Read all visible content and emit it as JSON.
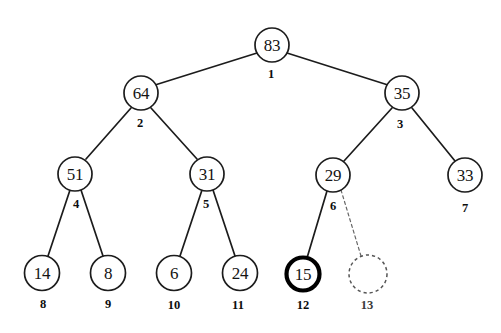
{
  "diagram": {
    "background_color": "#ffffff",
    "stroke_color": "#1c1c1c",
    "highlight_color": "#000000",
    "dashed_color": "#666666",
    "nodes": [
      {
        "id": "n1",
        "value": "83",
        "index": "1",
        "cx": 272,
        "cy": 45,
        "r": 17,
        "style": "normal",
        "label_x": 271,
        "label_y": 74
      },
      {
        "id": "n2",
        "value": "64",
        "index": "2",
        "cx": 141,
        "cy": 93,
        "r": 17,
        "style": "normal",
        "label_x": 140,
        "label_y": 123
      },
      {
        "id": "n3",
        "value": "35",
        "index": "3",
        "cx": 402,
        "cy": 93,
        "r": 17,
        "style": "normal",
        "label_x": 400,
        "label_y": 124
      },
      {
        "id": "n4",
        "value": "51",
        "index": "4",
        "cx": 75,
        "cy": 174,
        "r": 17,
        "style": "normal",
        "label_x": 76,
        "label_y": 204
      },
      {
        "id": "n5",
        "value": "31",
        "index": "5",
        "cx": 207,
        "cy": 174,
        "r": 17,
        "style": "normal",
        "label_x": 206,
        "label_y": 204
      },
      {
        "id": "n6",
        "value": "29",
        "index": "6",
        "cx": 333,
        "cy": 175,
        "r": 17,
        "style": "normal",
        "label_x": 333,
        "label_y": 206
      },
      {
        "id": "n7",
        "value": "33",
        "index": "7",
        "cx": 465,
        "cy": 175,
        "r": 17,
        "style": "normal",
        "label_x": 465,
        "label_y": 208
      },
      {
        "id": "n8",
        "value": "14",
        "index": "8",
        "cx": 42,
        "cy": 273,
        "r": 17.5,
        "style": "normal",
        "label_x": 43,
        "label_y": 304
      },
      {
        "id": "n9",
        "value": "8",
        "index": "9",
        "cx": 108,
        "cy": 273,
        "r": 17.5,
        "style": "normal",
        "label_x": 108,
        "label_y": 304
      },
      {
        "id": "n10",
        "value": "6",
        "index": "10",
        "cx": 174,
        "cy": 273,
        "r": 17.5,
        "style": "normal",
        "label_x": 174,
        "label_y": 305
      },
      {
        "id": "n11",
        "value": "24",
        "index": "11",
        "cx": 240,
        "cy": 273,
        "r": 17.5,
        "style": "normal",
        "label_x": 238,
        "label_y": 305
      },
      {
        "id": "n12",
        "value": "15",
        "index": "12",
        "cx": 303,
        "cy": 274,
        "r": 16.5,
        "style": "bold",
        "label_x": 303,
        "label_y": 305
      },
      {
        "id": "n13",
        "value": "",
        "index": "13",
        "cx": 368,
        "cy": 274,
        "r": 19,
        "style": "dashed",
        "label_x": 367,
        "label_y": 305
      }
    ],
    "edges": [
      {
        "id": "e1",
        "from": "n1",
        "to": "n2",
        "style": "solid",
        "x1": 257,
        "y1": 53,
        "x2": 155,
        "y2": 85
      },
      {
        "id": "e2",
        "from": "n1",
        "to": "n3",
        "style": "solid",
        "x1": 287,
        "y1": 53,
        "x2": 388,
        "y2": 85
      },
      {
        "id": "e3",
        "from": "n2",
        "to": "n4",
        "style": "solid",
        "x1": 131,
        "y1": 108,
        "x2": 86,
        "y2": 159
      },
      {
        "id": "e4",
        "from": "n2",
        "to": "n5",
        "style": "solid",
        "x1": 151,
        "y1": 108,
        "x2": 197,
        "y2": 159
      },
      {
        "id": "e5",
        "from": "n3",
        "to": "n6",
        "style": "solid",
        "x1": 392,
        "y1": 108,
        "x2": 344,
        "y2": 161
      },
      {
        "id": "e6",
        "from": "n3",
        "to": "n7",
        "style": "solid",
        "x1": 412,
        "y1": 108,
        "x2": 455,
        "y2": 161
      },
      {
        "id": "e7",
        "from": "n4",
        "to": "n8",
        "style": "solid",
        "x1": 70,
        "y1": 190,
        "x2": 48,
        "y2": 256
      },
      {
        "id": "e8",
        "from": "n4",
        "to": "n9",
        "style": "solid",
        "x1": 81,
        "y1": 190,
        "x2": 103,
        "y2": 256
      },
      {
        "id": "e9",
        "from": "n5",
        "to": "n10",
        "style": "solid",
        "x1": 202,
        "y1": 190,
        "x2": 180,
        "y2": 256
      },
      {
        "id": "e10",
        "from": "n5",
        "to": "n11",
        "style": "solid",
        "x1": 213,
        "y1": 190,
        "x2": 235,
        "y2": 256
      },
      {
        "id": "e11",
        "from": "n6",
        "to": "n12",
        "style": "solid",
        "x1": 327,
        "y1": 191,
        "x2": 307,
        "y2": 258
      },
      {
        "id": "e12",
        "from": "n6",
        "to": "n13",
        "style": "dashed",
        "x1": 341,
        "y1": 190,
        "x2": 361,
        "y2": 256
      }
    ]
  }
}
